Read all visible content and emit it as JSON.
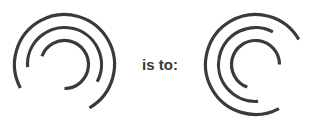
{
  "canvas": {
    "width": 320,
    "height": 129,
    "background_color": "#ffffff"
  },
  "relation": {
    "label": "is to:"
  },
  "style": {
    "stroke_color": "#3a3a3a",
    "stroke_width": 3.2,
    "stroke_linecap": "butt"
  },
  "figures": [
    {
      "id": "left-figure",
      "name": "spiral-arcs-figure-a",
      "center_x": 64.5,
      "center_y": 64.5,
      "rotation_deg": 0,
      "arcs": [
        {
          "name": "outer-arc",
          "radius": 50,
          "start_deg": 152,
          "sweep_deg": 268
        },
        {
          "name": "middle-arc",
          "radius": 37,
          "start_deg": 176,
          "sweep_deg": 212
        },
        {
          "name": "inner-arc",
          "radius": 24,
          "start_deg": 200,
          "sweep_deg": 250
        }
      ]
    },
    {
      "id": "right-figure",
      "name": "spiral-arcs-figure-b",
      "center_x": 64.5,
      "center_y": 64.5,
      "rotation_deg": -90,
      "arcs": [
        {
          "name": "outer-arc",
          "radius": 50,
          "start_deg": 152,
          "sweep_deg": 268
        },
        {
          "name": "middle-arc",
          "radius": 37,
          "start_deg": 176,
          "sweep_deg": 212
        },
        {
          "name": "inner-arc",
          "radius": 24,
          "start_deg": 200,
          "sweep_deg": 250
        }
      ]
    }
  ]
}
